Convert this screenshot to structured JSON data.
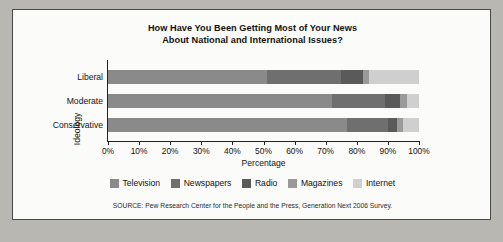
{
  "chart_data": {
    "type": "bar",
    "orientation": "horizontal",
    "stacked": true,
    "normalized_percent": true,
    "title": "How Have You Been Getting Most of Your News About National and International Issues?",
    "title_lines": [
      "How Have You Been Getting Most of Your News",
      "About National and International Issues?"
    ],
    "xlabel": "Percentage",
    "ylabel": "Ideology",
    "xlim": [
      0,
      100
    ],
    "grid": false,
    "legend_position": "bottom",
    "categories": [
      "Liberal",
      "Moderate",
      "Conservative"
    ],
    "xticks": [
      0,
      10,
      20,
      30,
      40,
      50,
      60,
      70,
      80,
      90,
      100
    ],
    "xticklabels": [
      "0%",
      "10%",
      "20%",
      "30%",
      "40%",
      "50%",
      "60%",
      "70%",
      "80%",
      "90%",
      "100%"
    ],
    "series": [
      {
        "name": "Television",
        "color": "#8a8a8a",
        "values": [
          51,
          72,
          77
        ]
      },
      {
        "name": "Newspapers",
        "color": "#6f6f6f",
        "values": [
          24,
          17,
          13
        ]
      },
      {
        "name": "Radio",
        "color": "#5a5a5a",
        "values": [
          7,
          5,
          3
        ]
      },
      {
        "name": "Magazines",
        "color": "#9a9a9a",
        "values": [
          2,
          2,
          2
        ]
      },
      {
        "name": "Internet",
        "color": "#cfcfcf",
        "values": [
          16,
          4,
          5
        ]
      }
    ],
    "annotations": {
      "source": "SOURCE: Pew Research Center for the People and the Press, Generation Next 2006 Survey."
    }
  },
  "legend": {
    "items": [
      {
        "label": "Television"
      },
      {
        "label": "Newspapers"
      },
      {
        "label": "Radio"
      },
      {
        "label": "Magazines"
      },
      {
        "label": "Internet"
      }
    ]
  },
  "axes": {
    "x_title": "Percentage",
    "y_title": "Ideology",
    "x_tick_labels": [
      "0%",
      "10%",
      "20%",
      "30%",
      "40%",
      "50%",
      "60%",
      "70%",
      "80%",
      "90%",
      "100%"
    ],
    "y_tick_labels": [
      "Liberal",
      "Moderate",
      "Conservative"
    ]
  },
  "title": {
    "line1": "How Have You Been Getting Most of Your News",
    "line2": "About National and International Issues?"
  },
  "source": {
    "text": "SOURCE: Pew Research Center for the People and the Press, Generation Next 2006 Survey."
  }
}
